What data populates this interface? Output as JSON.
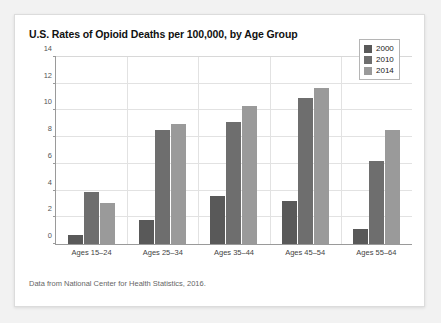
{
  "card": {
    "title": "U.S. Rates of Opioid Deaths per 100,000, by Age Group",
    "footnote": "Data from National Center for Health Statistics, 2016."
  },
  "legend": {
    "position": "top-right",
    "entries": [
      {
        "label": "2000",
        "color": "#595959"
      },
      {
        "label": "2010",
        "color": "#6e6e6e"
      },
      {
        "label": "2014",
        "color": "#9a9a9a"
      }
    ]
  },
  "chart_data": {
    "type": "bar",
    "title": "U.S. Rates of Opioid Deaths per 100,000, by Age Group",
    "xlabel": "",
    "ylabel": "",
    "ylim": [
      0,
      14
    ],
    "yticks": [
      0,
      2,
      4,
      6,
      8,
      10,
      12,
      14
    ],
    "ytick_labels": [
      "0",
      "2",
      "4",
      "6",
      "8",
      "10",
      "12",
      "14"
    ],
    "grid": true,
    "categories": [
      "Ages 15–24",
      "Ages 25–34",
      "Ages 35–44",
      "Ages 45–54",
      "Ages 55–64"
    ],
    "series": [
      {
        "name": "2000",
        "color": "#595959",
        "values": [
          0.7,
          1.8,
          3.6,
          3.2,
          1.1
        ]
      },
      {
        "name": "2010",
        "color": "#6e6e6e",
        "values": [
          3.9,
          8.5,
          9.1,
          10.9,
          6.2
        ]
      },
      {
        "name": "2014",
        "color": "#9a9a9a",
        "values": [
          3.1,
          9.0,
          10.3,
          11.7,
          8.5
        ]
      }
    ]
  }
}
